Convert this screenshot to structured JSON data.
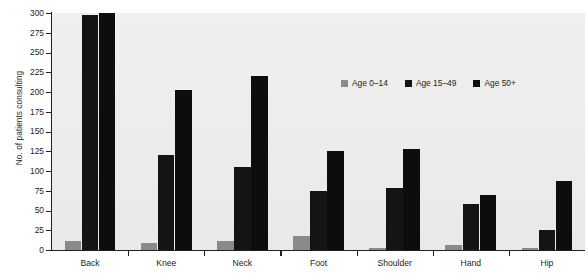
{
  "chart_data": {
    "type": "bar",
    "title": "",
    "xlabel": "",
    "ylabel": "No. of patients consulting",
    "ylim": [
      0,
      300
    ],
    "yticks": [
      0,
      25,
      50,
      75,
      100,
      125,
      150,
      175,
      200,
      225,
      250,
      275,
      300
    ],
    "grid": false,
    "legend_position": "inside-top-right",
    "categories": [
      "Back",
      "Knee",
      "Neck",
      "Foot",
      "Shoulder",
      "Hand",
      "Hip"
    ],
    "series": [
      {
        "name": "Age 0–14",
        "color": "#8a8a8a",
        "values": [
          12,
          9,
          11,
          18,
          2,
          6,
          3
        ]
      },
      {
        "name": "Age 15–49",
        "color": "#141414",
        "values": [
          297,
          120,
          105,
          75,
          78,
          58,
          25
        ]
      },
      {
        "name": "Age 50+",
        "color": "#0d0d0d",
        "values": [
          300,
          202,
          220,
          125,
          128,
          70,
          87
        ]
      }
    ]
  },
  "axes": {
    "y_title": "No. of patients consulting",
    "y_tick_labels": [
      "300",
      "275",
      "250",
      "225",
      "200",
      "175",
      "150",
      "125",
      "100",
      "75",
      "50",
      "25",
      "0"
    ],
    "x_tick_labels": [
      "Back",
      "Knee",
      "Neck",
      "Foot",
      "Shoulder",
      "Hand",
      "Hip"
    ]
  },
  "legend": {
    "items": [
      {
        "label": "Age 0–14",
        "color": "#8a8a8a"
      },
      {
        "label": "Age 15–49",
        "color": "#141414"
      },
      {
        "label": "Age 50+",
        "color": "#0d0d0d"
      }
    ]
  },
  "colors": {
    "plot_background": "#ececec",
    "axis": "#231f20",
    "text": "#231f20",
    "series_0": "#8a8a8a",
    "series_1": "#141414",
    "series_2": "#0d0d0d"
  }
}
